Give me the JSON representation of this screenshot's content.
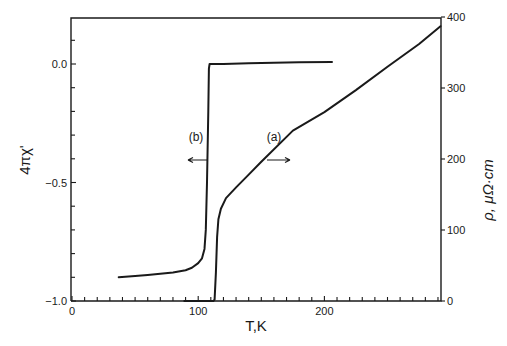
{
  "chart_data": {
    "type": "line",
    "title": "",
    "xlabel": "T,K",
    "ylabel_left": "4πχ'",
    "ylabel_right": "ρ,  μΩ·cm",
    "xlim": [
      0,
      293
    ],
    "ylim_left": [
      -1.0,
      0.19
    ],
    "ylim_right": [
      0,
      400
    ],
    "x_ticks": [
      0,
      100,
      200
    ],
    "x_tick_labels": [
      "0",
      "100",
      "200"
    ],
    "y_left_ticks": [
      0.0,
      -0.5,
      -1.0
    ],
    "y_left_tick_labels": [
      "0.0",
      "-0.5",
      "-1.0"
    ],
    "y_right_ticks": [
      0,
      100,
      200,
      300,
      400
    ],
    "y_right_tick_labels": [
      "0",
      "100",
      "200",
      "300",
      "400"
    ],
    "grid": false,
    "legend": "none",
    "series": [
      {
        "name": "(b) 4πχ' (AC susceptibility)",
        "axis": "left",
        "annotation": "(b)",
        "arrow": "left",
        "x": [
          37,
          50,
          60,
          70,
          80,
          90,
          95,
          100,
          103,
          105,
          106,
          107,
          108,
          108.5,
          109,
          120,
          140,
          160,
          180,
          206
        ],
        "values": [
          -0.9,
          -0.895,
          -0.89,
          -0.885,
          -0.88,
          -0.87,
          -0.86,
          -0.84,
          -0.82,
          -0.78,
          -0.7,
          -0.5,
          -0.2,
          -0.02,
          0.0,
          0.0,
          0.003,
          0.005,
          0.007,
          0.008
        ]
      },
      {
        "name": "(a) ρ (resistivity, μΩ·cm)",
        "axis": "right",
        "annotation": "(a)",
        "arrow": "right",
        "x": [
          89,
          100,
          112,
          113,
          114,
          115,
          116,
          118,
          122,
          130,
          140,
          150,
          175,
          200,
          225,
          250,
          275,
          292
        ],
        "values": [
          0,
          0,
          0,
          2,
          40,
          90,
          115,
          130,
          145,
          160,
          178,
          196,
          240,
          266,
          297,
          330,
          362,
          387
        ]
      }
    ]
  }
}
